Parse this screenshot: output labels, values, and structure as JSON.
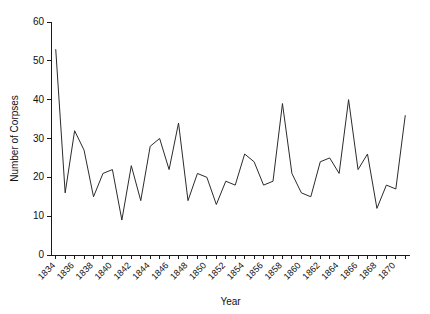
{
  "chart_data": {
    "type": "line",
    "title": "",
    "xlabel": "Year",
    "ylabel": "Number of Corpses",
    "xlim": [
      1833.5,
      1871.5
    ],
    "ylim": [
      0,
      60
    ],
    "grid": false,
    "legend": false,
    "line_color": "#2b2b2b",
    "yticks": [
      0,
      10,
      20,
      30,
      40,
      50,
      60
    ],
    "ytick_labels": [
      "0",
      "10",
      "20",
      "30",
      "40",
      "50",
      "60"
    ],
    "xticks": [
      1834,
      1836,
      1838,
      1840,
      1842,
      1844,
      1846,
      1848,
      1850,
      1852,
      1854,
      1856,
      1858,
      1860,
      1862,
      1864,
      1866,
      1868,
      1870
    ],
    "xtick_labels": [
      "1834",
      "1836",
      "1838",
      "1840",
      "1842",
      "1844",
      "1846",
      "1848",
      "1850",
      "1852",
      "1854",
      "1856",
      "1858",
      "1860",
      "1862",
      "1864",
      "1866",
      "1868",
      "1870"
    ],
    "x": [
      1834,
      1835,
      1836,
      1837,
      1838,
      1839,
      1840,
      1841,
      1842,
      1843,
      1844,
      1845,
      1846,
      1847,
      1848,
      1849,
      1850,
      1851,
      1852,
      1853,
      1854,
      1855,
      1856,
      1857,
      1858,
      1859,
      1860,
      1861,
      1862,
      1863,
      1864,
      1865,
      1866,
      1867,
      1868,
      1869,
      1870,
      1871
    ],
    "values": [
      53,
      16,
      32,
      27,
      15,
      21,
      22,
      9,
      23,
      14,
      28,
      30,
      22,
      34,
      14,
      21,
      20,
      13,
      19,
      18,
      26,
      24,
      18,
      19,
      39,
      21,
      16,
      15,
      24,
      25,
      21,
      40,
      22,
      26,
      12,
      18,
      17,
      36
    ],
    "series": [
      {
        "name": "Number of Corpses",
        "values": [
          53,
          16,
          32,
          27,
          15,
          21,
          22,
          9,
          23,
          14,
          28,
          30,
          22,
          34,
          14,
          21,
          20,
          13,
          19,
          18,
          26,
          24,
          18,
          19,
          39,
          21,
          16,
          15,
          24,
          25,
          21,
          40,
          22,
          26,
          12,
          18,
          17,
          36
        ]
      }
    ],
    "annotations": []
  }
}
